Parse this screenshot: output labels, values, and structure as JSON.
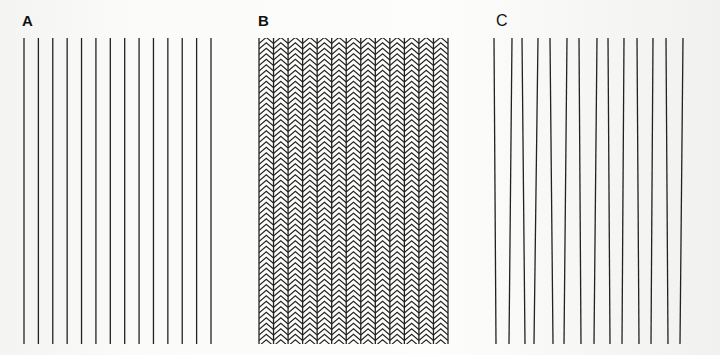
{
  "figure": {
    "line_color": "#222222",
    "panels": [
      {
        "label": "A",
        "description": "parallel vertical lines",
        "line_count": 14,
        "x_start": 24,
        "x_end": 211,
        "y_top": 38,
        "y_bottom": 344
      },
      {
        "label": "B",
        "description": "parallel vertical lines with alternating chevron hatching",
        "line_count": 14,
        "x_start": 259,
        "x_end": 448,
        "y_top": 38,
        "y_bottom": 344,
        "chevron_spacing": 5.5
      },
      {
        "label": "C",
        "description": "lines tilted in alternating directions",
        "line_count": 14,
        "tops": [
          494,
          512,
          522,
          538,
          550,
          567,
          579,
          597,
          608,
          624,
          637,
          653,
          666,
          683
        ],
        "bottoms": [
          496,
          509,
          525,
          534,
          553,
          564,
          581,
          594,
          610,
          622,
          639,
          651,
          668,
          680
        ],
        "y_top": 38,
        "y_bottom": 344
      }
    ]
  }
}
